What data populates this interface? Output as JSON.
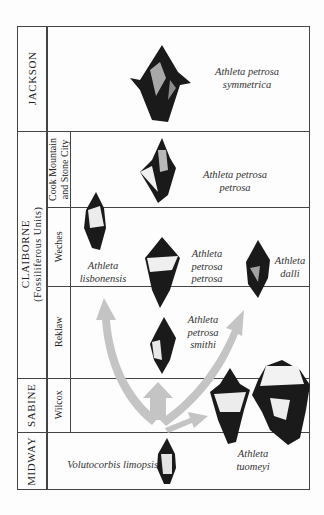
{
  "series": [
    {
      "name": "JACKSON"
    },
    {
      "name": "CLAIBORNE",
      "subtitle": "(Fossiliferous Units)"
    },
    {
      "name": "SABINE"
    },
    {
      "name": "MIDWAY"
    }
  ],
  "formations": [
    {
      "name_line1": "Cook Mountain",
      "name_line2": "and Stone City"
    },
    {
      "name": "Weches"
    },
    {
      "name": "Reklaw"
    },
    {
      "name": "Wilcox"
    }
  ],
  "species": {
    "jackson": {
      "line1": "Athleta petrosa",
      "line2": "symmetrica"
    },
    "cook_mountain": {
      "line1": "Athleta petrosa",
      "line2": "petrosa"
    },
    "weches_lisbonensis": {
      "line1": "Athleta",
      "line2": "lisbonensis"
    },
    "weches_petrosa": {
      "line1": "Athleta",
      "line2": "petrosa",
      "line3": "petrosa"
    },
    "weches_dalli": {
      "line1": "Athleta",
      "line2": "dalli"
    },
    "reklaw_smithi": {
      "line1": "Athleta",
      "line2": "petrosa",
      "line3": "smithi"
    },
    "sabine_tuomeyi": {
      "line1": "Athleta",
      "line2": "tuomeyi"
    },
    "midway_volutocorbis": {
      "line1": "Volutocorbis limopsis"
    }
  },
  "colors": {
    "arrow": "#c4c4c4",
    "shell_dark": "#1a1a1a",
    "shell_light": "#e8e8e8",
    "border": "#444444"
  }
}
